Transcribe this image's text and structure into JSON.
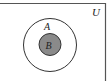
{
  "diagram": {
    "type": "venn",
    "universal_set": {
      "label": "U"
    },
    "sets": [
      {
        "label": "A",
        "fill": "#ffffff",
        "contains": [
          "B"
        ]
      },
      {
        "label": "B",
        "fill": "#8a8a8a",
        "shaded": true,
        "subset_of": "A"
      }
    ],
    "colors": {
      "stroke": "#333333",
      "shade": "#8a8a8a",
      "background": "#ffffff"
    }
  }
}
